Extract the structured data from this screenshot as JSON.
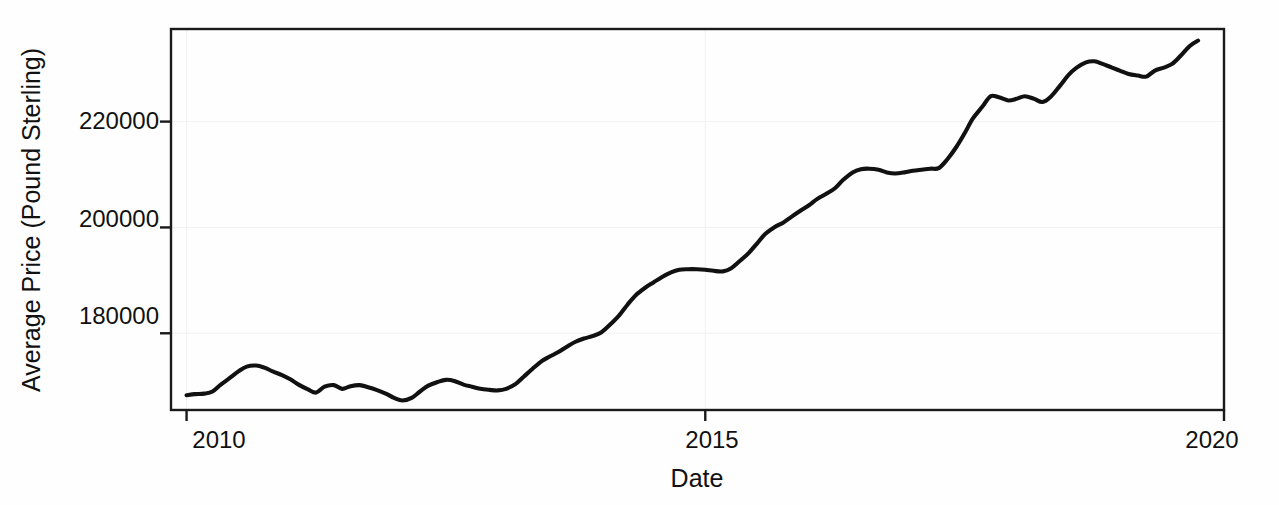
{
  "chart_data": {
    "type": "line",
    "title": "",
    "xlabel": "Date",
    "ylabel": "Average Price (Pound Sterling)",
    "xlim": [
      2009.85,
      2020.0
    ],
    "ylim": [
      165500,
      237500
    ],
    "xticks": [
      2010,
      2015,
      2020
    ],
    "xticklabels": [
      "2010",
      "2015",
      "2020"
    ],
    "yticks": [
      180000,
      200000,
      220000
    ],
    "yticklabels": [
      "180000",
      "200000",
      "220000"
    ],
    "grid": false,
    "legend": null,
    "line_color": "#111111",
    "series": [
      {
        "name": "Average Price",
        "x": [
          2010.0,
          2010.08,
          2010.17,
          2010.25,
          2010.33,
          2010.42,
          2010.5,
          2010.58,
          2010.67,
          2010.75,
          2010.83,
          2010.92,
          2011.0,
          2011.08,
          2011.17,
          2011.25,
          2011.33,
          2011.42,
          2011.5,
          2011.58,
          2011.67,
          2011.75,
          2011.83,
          2011.92,
          2012.0,
          2012.08,
          2012.17,
          2012.25,
          2012.33,
          2012.42,
          2012.5,
          2012.58,
          2012.67,
          2012.75,
          2012.83,
          2012.92,
          2013.0,
          2013.08,
          2013.17,
          2013.25,
          2013.33,
          2013.42,
          2013.5,
          2013.58,
          2013.67,
          2013.75,
          2013.83,
          2013.92,
          2014.0,
          2014.08,
          2014.17,
          2014.25,
          2014.33,
          2014.42,
          2014.5,
          2014.58,
          2014.67,
          2014.75,
          2014.83,
          2014.92,
          2015.0,
          2015.08,
          2015.17,
          2015.25,
          2015.33,
          2015.42,
          2015.5,
          2015.58,
          2015.67,
          2015.75,
          2015.83,
          2015.92,
          2016.0,
          2016.08,
          2016.17,
          2016.25,
          2016.33,
          2016.42,
          2016.5,
          2016.58,
          2016.67,
          2016.75,
          2016.83,
          2016.92,
          2017.0,
          2017.08,
          2017.17,
          2017.25,
          2017.33,
          2017.42,
          2017.5,
          2017.58,
          2017.67,
          2017.75,
          2017.83,
          2017.92,
          2018.0,
          2018.08,
          2018.17,
          2018.25,
          2018.33,
          2018.42,
          2018.5,
          2018.58,
          2018.67,
          2018.75,
          2018.83,
          2018.92,
          2019.0,
          2019.08,
          2019.17,
          2019.25,
          2019.33,
          2019.42,
          2019.5,
          2019.58,
          2019.67,
          2019.75
        ],
        "y": [
          168300,
          168500,
          168600,
          169000,
          170300,
          171600,
          172800,
          173700,
          173900,
          173500,
          172800,
          172100,
          171300,
          170300,
          169400,
          168800,
          169900,
          170200,
          169500,
          170000,
          170200,
          169800,
          169300,
          168600,
          167800,
          167300,
          167800,
          169000,
          170100,
          170800,
          171200,
          171000,
          170300,
          169900,
          169500,
          169300,
          169200,
          169500,
          170400,
          171800,
          173200,
          174700,
          175600,
          176400,
          177500,
          178400,
          179000,
          179500,
          180200,
          181600,
          183400,
          185400,
          187200,
          188600,
          189600,
          190600,
          191500,
          192000,
          192100,
          192100,
          192000,
          191800,
          191700,
          192300,
          193600,
          195200,
          197000,
          198800,
          200100,
          200900,
          202000,
          203200,
          204200,
          205400,
          206400,
          207400,
          209000,
          210400,
          211000,
          211100,
          210900,
          210400,
          210200,
          210400,
          210700,
          210900,
          211100,
          211200,
          212800,
          215200,
          217800,
          220600,
          222800,
          224800,
          224600,
          224000,
          224300,
          224800,
          224300,
          223700,
          224700,
          226800,
          228800,
          230200,
          231200,
          231400,
          230900,
          230200,
          229600,
          229000,
          228700,
          228500,
          229600,
          230200,
          230900,
          232400,
          234300,
          235300
        ]
      }
    ]
  },
  "axis": {
    "xlabel": "Date",
    "ylabel": "Average Price (Pound Sterling)",
    "xticklabels": [
      "2010",
      "2015",
      "2020"
    ],
    "yticklabels": [
      "180000",
      "200000",
      "220000"
    ]
  }
}
